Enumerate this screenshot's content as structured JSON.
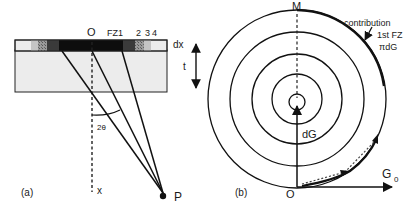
{
  "panel_a": {
    "label": "(a)",
    "origin_label": "O",
    "zone_labels": [
      "FZ1",
      "2",
      "3",
      "4"
    ],
    "dx_label": "dx",
    "t_label": "t",
    "angle_label": "2θ",
    "x_label": "x",
    "point_label": "P",
    "colors": {
      "strip_dark": "#111111",
      "strip_mid": "#444444",
      "strip_hatch": "#8a8a8a",
      "strip_light": "#c4c4c4",
      "strip_white": "#ececec",
      "slab_fill": "#ececec"
    }
  },
  "panel_b": {
    "label": "(b)",
    "top_label": "M",
    "origin_label": "O",
    "vector_label": "dG",
    "g0_label": "G",
    "g0_subscript": "0",
    "contribution_lines": [
      "contribution",
      "1st FZ",
      "πdG"
    ]
  }
}
